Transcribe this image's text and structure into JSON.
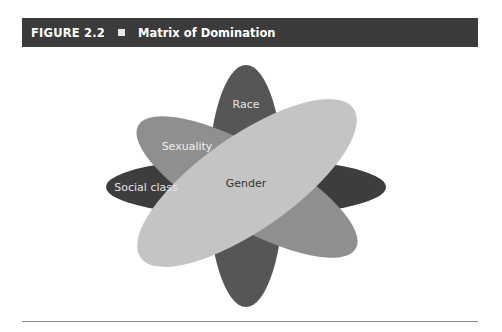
{
  "figure": {
    "number": "FIGURE 2.2",
    "bullet_icon": "square-bullet-icon",
    "title": "Matrix of Domination"
  },
  "diagram": {
    "type": "overlapping-ellipses",
    "center": [
      246,
      186
    ],
    "ellipses": [
      {
        "label": "Social class",
        "color": "#3d3d3d",
        "text_color": "#e6e6e6",
        "rx": 140,
        "ry": 29,
        "rotation": 0
      },
      {
        "label": "Race",
        "color": "#565656",
        "text_color": "#e6e6e6",
        "rx": 38,
        "ry": 121,
        "rotation": 0
      },
      {
        "label": "Sexuality",
        "color": "#8f8f8f",
        "text_color": "#f0f0f0",
        "rx": 125,
        "ry": 40,
        "rotation": 29.5
      },
      {
        "label": "Gender",
        "color": "#c4c4c4",
        "text_color": "#333333",
        "rx": 130,
        "ry": 47,
        "rotation": -35
      }
    ]
  },
  "colors": {
    "header_bg": "#3b3b3b",
    "header_text": "#ffffff",
    "rule": "#8a8a8a"
  }
}
